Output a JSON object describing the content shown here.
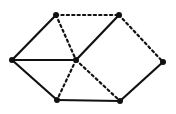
{
  "figure": {
    "title": "",
    "background_color": "#ffffff",
    "width": 176,
    "height": 114
  },
  "graph": {
    "description": "Undirected graph drawn as a hexagon with a central vertex; edges are either solid or dashed",
    "vertex_count": 7,
    "edge_count": 12,
    "style": {
      "vertex_color": "#111111",
      "vertex_radius": 3,
      "edge_color": "#111111",
      "solid_width": 2.2,
      "dashed_width": 2.2,
      "dash_pattern": "2.2 3.2"
    },
    "vertices": [
      {
        "id": "top-left",
        "label": "",
        "x": 56,
        "y": 15
      },
      {
        "id": "top-right",
        "label": "",
        "x": 119,
        "y": 15
      },
      {
        "id": "left",
        "label": "",
        "x": 12,
        "y": 60
      },
      {
        "id": "center",
        "label": "",
        "x": 76,
        "y": 60
      },
      {
        "id": "right",
        "label": "",
        "x": 163,
        "y": 62
      },
      {
        "id": "bottom-left",
        "label": "",
        "x": 57,
        "y": 100
      },
      {
        "id": "bottom-right",
        "label": "",
        "x": 120,
        "y": 101
      }
    ],
    "edges": [
      {
        "id": "e1",
        "from": "top-left",
        "to": "left",
        "style": "solid"
      },
      {
        "id": "e2",
        "from": "top-left",
        "to": "top-right",
        "style": "dashed"
      },
      {
        "id": "e3",
        "from": "top-left",
        "to": "center",
        "style": "dashed"
      },
      {
        "id": "e4",
        "from": "top-right",
        "to": "center",
        "style": "solid"
      },
      {
        "id": "e5",
        "from": "top-right",
        "to": "right",
        "style": "dashed"
      },
      {
        "id": "e6",
        "from": "left",
        "to": "center",
        "style": "solid"
      },
      {
        "id": "e7",
        "from": "left",
        "to": "bottom-left",
        "style": "solid"
      },
      {
        "id": "e8",
        "from": "center",
        "to": "bottom-left",
        "style": "dashed"
      },
      {
        "id": "e9",
        "from": "center",
        "to": "bottom-right",
        "style": "dashed"
      },
      {
        "id": "e10",
        "from": "bottom-left",
        "to": "bottom-right",
        "style": "solid"
      },
      {
        "id": "e11",
        "from": "bottom-right",
        "to": "right",
        "style": "solid"
      }
    ]
  }
}
